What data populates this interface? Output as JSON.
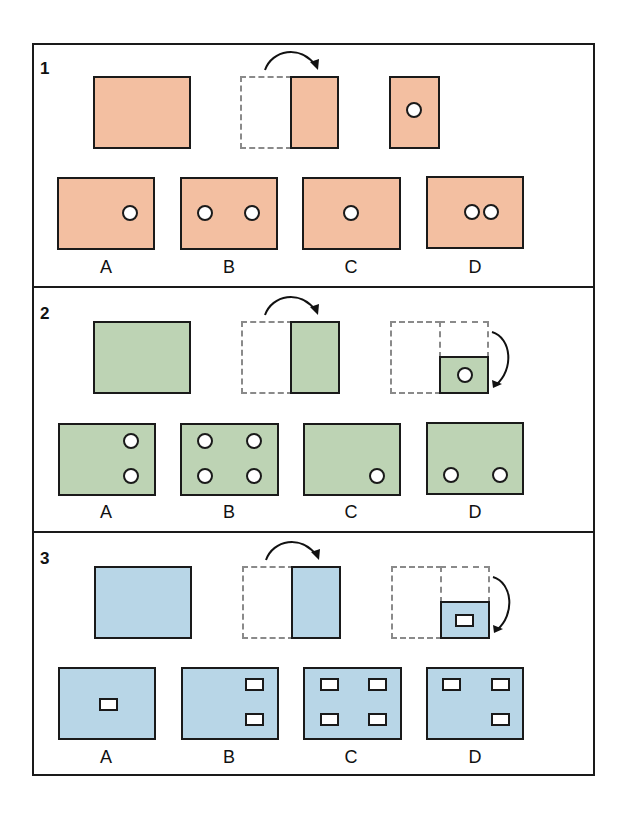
{
  "colors": {
    "panel1_fill": "#f3bfa1",
    "panel2_fill": "#bdd3b4",
    "panel3_fill": "#b8d6e7",
    "stroke": "#1a1a1a",
    "dashed_stroke": "#8a8a8a",
    "hole": "#ffffff"
  },
  "panels": [
    {
      "number": "1",
      "description": "Paper folded once left-to-right, then a circular hole punched",
      "punch_shape": "circle",
      "options": [
        {
          "label": "A",
          "holes": 1
        },
        {
          "label": "B",
          "holes": 2
        },
        {
          "label": "C",
          "holes": 1
        },
        {
          "label": "D",
          "holes": 2
        }
      ]
    },
    {
      "number": "2",
      "description": "Paper folded left-to-right, then top-to-bottom, then a circular hole punched",
      "punch_shape": "circle",
      "options": [
        {
          "label": "A",
          "holes": 2
        },
        {
          "label": "B",
          "holes": 4
        },
        {
          "label": "C",
          "holes": 1
        },
        {
          "label": "D",
          "holes": 2
        }
      ]
    },
    {
      "number": "3",
      "description": "Paper folded left-to-right, then top-to-bottom, then a rectangular hole punched",
      "punch_shape": "rectangle",
      "options": [
        {
          "label": "A",
          "holes": 1
        },
        {
          "label": "B",
          "holes": 2
        },
        {
          "label": "C",
          "holes": 4
        },
        {
          "label": "D",
          "holes": 3
        }
      ]
    }
  ]
}
